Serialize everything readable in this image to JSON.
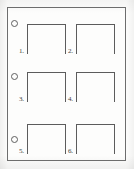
{
  "document": {
    "type": "scanned-worksheet",
    "title": "",
    "background_color": "#fdfdfc",
    "ink_color": "#5c5c5c",
    "border_color": "#6d6d6d",
    "page_width": 134,
    "page_height": 169
  },
  "sheet": {
    "border": {
      "x": 7,
      "y": 7,
      "width": 119,
      "height": 154
    }
  },
  "punch_holes": [
    {
      "id": "punch-hole-1",
      "x": 11,
      "y": 20,
      "size": 7
    },
    {
      "id": "punch-hole-2",
      "x": 11,
      "y": 73,
      "size": 7
    },
    {
      "id": "punch-hole-3",
      "x": 11,
      "y": 136,
      "size": 7
    }
  ],
  "brackets": [
    {
      "number": "1.",
      "x": 27,
      "y": 24,
      "width": 39,
      "height": 30,
      "label_x": 19,
      "label_y": 48
    },
    {
      "number": "2.",
      "x": 76,
      "y": 24,
      "width": 39,
      "height": 30,
      "label_x": 68,
      "label_y": 48
    },
    {
      "number": "3.",
      "x": 27,
      "y": 72,
      "width": 39,
      "height": 30,
      "label_x": 19,
      "label_y": 96
    },
    {
      "number": "4.",
      "x": 76,
      "y": 72,
      "width": 39,
      "height": 30,
      "label_x": 68,
      "label_y": 96
    },
    {
      "number": "5.",
      "x": 27,
      "y": 124,
      "width": 39,
      "height": 30,
      "label_x": 19,
      "label_y": 148
    },
    {
      "number": "6.",
      "x": 76,
      "y": 124,
      "width": 39,
      "height": 30,
      "label_x": 68,
      "label_y": 148
    }
  ]
}
